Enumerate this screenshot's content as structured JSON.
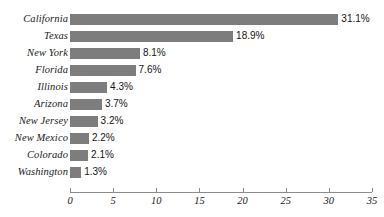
{
  "chart_data": {
    "type": "bar",
    "orientation": "horizontal",
    "title": "",
    "xlabel": "",
    "ylabel": "",
    "categories": [
      "California",
      "Texas",
      "New York",
      "Florida",
      "Illinois",
      "Arizona",
      "New Jersey",
      "New Mexico",
      "Colorado",
      "Washington"
    ],
    "values": [
      31.1,
      18.9,
      8.1,
      7.6,
      4.3,
      3.7,
      3.2,
      2.2,
      2.1,
      1.3
    ],
    "value_labels": [
      "31.1%",
      "18.9%",
      "8.1%",
      "7.6%",
      "4.3%",
      "3.7%",
      "3.2%",
      "2.2%",
      "2.1%",
      "1.3%"
    ],
    "xlim": [
      0,
      35
    ],
    "xticks": [
      0,
      5,
      10,
      15,
      20,
      25,
      30,
      35
    ],
    "xtick_labels": [
      "0",
      "5",
      "10",
      "15",
      "20",
      "25",
      "30",
      "35"
    ],
    "grid": false,
    "legend": false,
    "bar_color": "#7d7d7d",
    "axis_color": "#8c8c8c",
    "background_color": "#ffffff",
    "text_color": "#1a1a1a"
  }
}
